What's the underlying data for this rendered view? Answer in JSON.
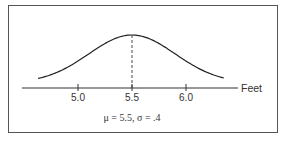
{
  "chart_data": {
    "type": "line",
    "title": "",
    "subtitle": "",
    "xlabel": "Feet",
    "ylabel": "",
    "x_ticks": [
      5.0,
      5.5,
      6.0
    ],
    "x_tick_labels": [
      "5.0",
      "5.5",
      "6.0"
    ],
    "xlim": [
      4.53,
      6.53
    ],
    "grid": false,
    "legend": null,
    "distribution": {
      "family": "normal",
      "mean": 5.5,
      "sd": 0.4
    },
    "annotations": [
      {
        "type": "dashed-vertical-line",
        "x": 5.5,
        "label": "mean"
      }
    ],
    "caption": "μ = 5.5, σ = .4",
    "series": [
      {
        "name": "normal density",
        "x_range": [
          4.63,
          6.35
        ]
      }
    ]
  },
  "labels": {
    "axis": "Feet",
    "tick_0": "5.0",
    "tick_1": "5.5",
    "tick_2": "6.0",
    "caption": "μ = 5.5, σ = .4"
  }
}
